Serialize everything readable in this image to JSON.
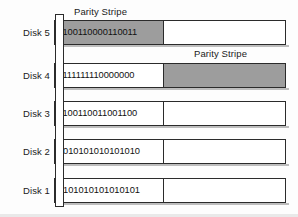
{
  "figure": {
    "colors": {
      "shaded_fill": "#9d9d9d",
      "plain_fill": "#ffffff",
      "outline": "#2b2b2b",
      "text": "#1b1b1b"
    }
  },
  "captions": {
    "parity_top": "Parity Stripe",
    "parity_second": "Parity Stripe"
  },
  "disks": [
    {
      "label": "Disk 5",
      "bits": "1100110000110011",
      "left_segment_shaded": true,
      "right_segment_shaded": false
    },
    {
      "label": "Disk 4",
      "bits": "1111111110000000",
      "left_segment_shaded": false,
      "right_segment_shaded": true
    },
    {
      "label": "Disk 3",
      "bits": "1100110011001100",
      "left_segment_shaded": false,
      "right_segment_shaded": false
    },
    {
      "label": "Disk 2",
      "bits": "1010101010101010",
      "left_segment_shaded": false,
      "right_segment_shaded": false
    },
    {
      "label": "Disk 1",
      "bits": "0101010101010101",
      "left_segment_shaded": false,
      "right_segment_shaded": false
    }
  ]
}
